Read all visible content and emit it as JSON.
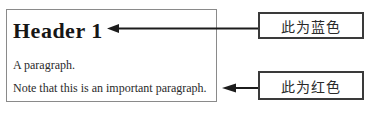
{
  "document_preview": {
    "header": "Header 1",
    "paragraph": "A paragraph.",
    "note": "Note that this is an important paragraph."
  },
  "callouts": [
    {
      "label": "此为蓝色"
    },
    {
      "label": "此为红色"
    }
  ],
  "colors": {
    "ink": "#1c1c1c",
    "doc_border": "#8a8a8a",
    "callout_border": "#3a3a3a",
    "background": "#ffffff"
  }
}
